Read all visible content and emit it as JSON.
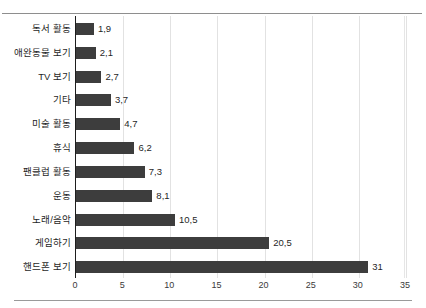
{
  "header": {
    "remnant_text": ""
  },
  "chart_data": {
    "type": "bar",
    "orientation": "horizontal",
    "title": "",
    "xlabel": "",
    "ylabel": "",
    "xlim": [
      0,
      35
    ],
    "xticks": [
      "0",
      "5",
      "10",
      "15",
      "20",
      "25",
      "30",
      "35"
    ],
    "grid": true,
    "legend": "none",
    "decimal_separator": ",",
    "bar_color": "#3d3d3d",
    "axis_color": "#1e1e1e",
    "gridline_color": "#e2e2e2",
    "categories": [
      "독서 활동",
      "애완동물 보기",
      "TV 보기",
      "기타",
      "미술 활동",
      "휴식",
      "팬클럽 활동",
      "운동",
      "노래/음악",
      "게임하기",
      "핸드폰 보기"
    ],
    "values": [
      1.9,
      2.1,
      2.7,
      3.7,
      4.7,
      6.2,
      7.3,
      8.1,
      10.5,
      20.5,
      31
    ],
    "value_labels": [
      "1,9",
      "2,1",
      "2,7",
      "3,7",
      "4,7",
      "6,2",
      "7,3",
      "8,1",
      "10,5",
      "20,5",
      "31"
    ]
  }
}
